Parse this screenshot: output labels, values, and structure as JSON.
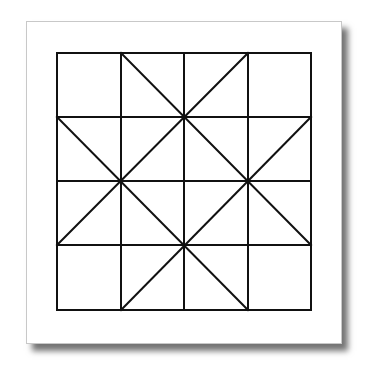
{
  "figure": {
    "type": "quilt-block-line-drawing",
    "paper": {
      "background": "#ffffff",
      "border": "#c8c8c8",
      "shadow": "#555555"
    },
    "stroke_color": "#111111",
    "stroke_width": 2,
    "grid": {
      "x": [
        57,
        121,
        184,
        248,
        311
      ],
      "y": [
        53,
        117,
        181,
        245,
        310
      ]
    },
    "diagonals": [
      {
        "x1": 121,
        "y1": 53,
        "x2": 311,
        "y2": 245
      },
      {
        "x1": 248,
        "y1": 53,
        "x2": 57,
        "y2": 245
      },
      {
        "x1": 57,
        "y1": 117,
        "x2": 248,
        "y2": 310
      },
      {
        "x1": 311,
        "y1": 117,
        "x2": 121,
        "y2": 310
      }
    ]
  }
}
